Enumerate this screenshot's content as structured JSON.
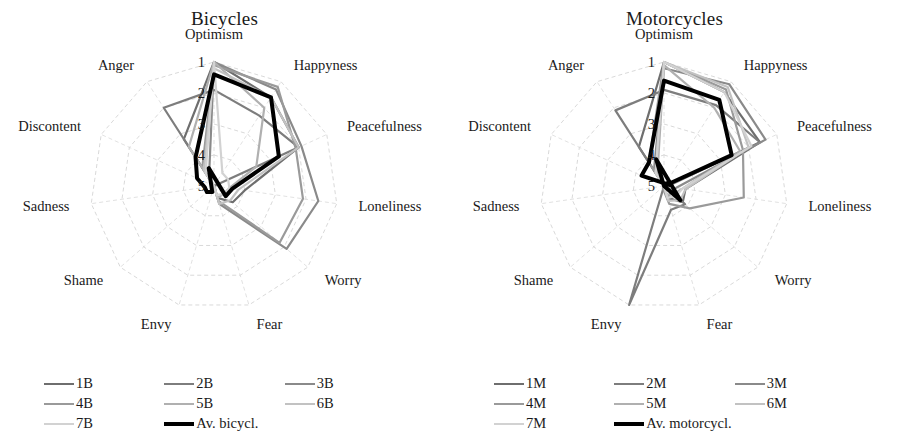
{
  "page": {
    "background": "#ffffff",
    "width": 899,
    "height": 440
  },
  "panels": [
    {
      "id": "bicycles",
      "title": "Bicycles",
      "legend": [
        {
          "label": "1B",
          "color": "#6e6e6e",
          "width": 2.4
        },
        {
          "label": "2B",
          "color": "#7d7d7d",
          "width": 2.4
        },
        {
          "label": "3B",
          "color": "#8a8a8a",
          "width": 2.4
        },
        {
          "label": "4B",
          "color": "#9a9a9a",
          "width": 2.4
        },
        {
          "label": "5B",
          "color": "#b0b0b0",
          "width": 2.4
        },
        {
          "label": "6B",
          "color": "#c2c2c2",
          "width": 2.4
        },
        {
          "label": "7B",
          "color": "#d2d2d2",
          "width": 2.4
        },
        {
          "label": "Av. bicycl.",
          "color": "#000000",
          "width": 4.0
        }
      ]
    },
    {
      "id": "motorcycles",
      "title": "Motorcycles",
      "legend": [
        {
          "label": "1M",
          "color": "#6e6e6e",
          "width": 2.4
        },
        {
          "label": "2M",
          "color": "#7d7d7d",
          "width": 2.4
        },
        {
          "label": "3M",
          "color": "#8a8a8a",
          "width": 2.4
        },
        {
          "label": "4M",
          "color": "#9a9a9a",
          "width": 2.4
        },
        {
          "label": "5M",
          "color": "#b0b0b0",
          "width": 2.4
        },
        {
          "label": "6M",
          "color": "#c2c2c2",
          "width": 2.4
        },
        {
          "label": "7M",
          "color": "#d2d2d2",
          "width": 2.4
        },
        {
          "label": "Av. motorcycl.",
          "color": "#000000",
          "width": 4.0
        }
      ]
    }
  ],
  "chart_data": [
    {
      "type": "radar",
      "title": "Bicycles",
      "xlabel": "",
      "ylabel": "",
      "grid": true,
      "legend_position": "bottom",
      "axis_direction": "inverted",
      "rlim": [
        1,
        5
      ],
      "rticks": [
        1,
        2,
        3,
        4,
        5
      ],
      "rtick_labels": [
        "1",
        "2",
        "3",
        "4",
        "5"
      ],
      "categories": [
        "Optimism",
        "Happyness",
        "Peacefulness",
        "Loneliness",
        "Worry",
        "Fear",
        "Envy",
        "Shame",
        "Sadness",
        "Discontent",
        "Anger"
      ],
      "series": [
        {
          "name": "1B",
          "color": "#6e6e6e",
          "values": [
            1.0,
            1.6,
            2.0,
            4.0,
            4.2,
            4.6,
            5.0,
            5.0,
            5.0,
            5.0,
            3.2
          ]
        },
        {
          "name": "2B",
          "color": "#7d7d7d",
          "values": [
            1.9,
            2.3,
            2.0,
            5.0,
            5.0,
            5.0,
            5.0,
            5.0,
            5.0,
            5.0,
            2.0
          ]
        },
        {
          "name": "3B",
          "color": "#8a8a8a",
          "values": [
            1.0,
            1.3,
            1.9,
            1.6,
            1.9,
            4.4,
            5.0,
            5.0,
            5.0,
            5.0,
            4.7
          ]
        },
        {
          "name": "4B",
          "color": "#9a9a9a",
          "values": [
            1.1,
            1.2,
            2.1,
            2.1,
            2.2,
            4.5,
            5.0,
            5.0,
            5.0,
            5.0,
            4.3
          ]
        },
        {
          "name": "5B",
          "color": "#b0b0b0",
          "values": [
            1.0,
            2.0,
            3.5,
            4.5,
            4.6,
            4.6,
            5.0,
            5.0,
            5.0,
            5.0,
            3.5
          ]
        },
        {
          "name": "6B",
          "color": "#c2c2c2",
          "values": [
            1.2,
            1.6,
            2.0,
            4.2,
            4.3,
            4.4,
            5.0,
            5.0,
            5.0,
            5.0,
            4.4
          ]
        },
        {
          "name": "7B",
          "color": "#d2d2d2",
          "values": [
            1.0,
            4.5,
            4.5,
            4.5,
            4.6,
            4.7,
            5.0,
            5.0,
            5.0,
            5.0,
            4.5
          ]
        },
        {
          "name": "Av. bicycl.",
          "color": "#000000",
          "values": [
            1.4,
            1.6,
            2.7,
            4.4,
            4.5,
            5.6,
            4.8,
            4.7,
            4.7,
            4.4,
            3.9
          ]
        }
      ]
    },
    {
      "type": "radar",
      "title": "Motorcycles",
      "xlabel": "",
      "ylabel": "",
      "grid": true,
      "legend_position": "bottom",
      "axis_direction": "inverted",
      "rlim": [
        1,
        5
      ],
      "rticks": [
        1,
        2,
        3,
        4,
        5
      ],
      "rtick_labels": [
        "1",
        "2",
        "3",
        "4",
        "5"
      ],
      "categories": [
        "Optimism",
        "Happyness",
        "Peacefulness",
        "Loneliness",
        "Worry",
        "Fear",
        "Envy",
        "Shame",
        "Sadness",
        "Discontent",
        "Anger"
      ],
      "series": [
        {
          "name": "1M",
          "color": "#6e6e6e",
          "values": [
            1.0,
            1.4,
            1.6,
            4.3,
            4.2,
            4.6,
            5.0,
            5.0,
            5.0,
            5.0,
            3.5
          ]
        },
        {
          "name": "2M",
          "color": "#7d7d7d",
          "values": [
            1.9,
            1.9,
            1.6,
            4.9,
            4.1,
            4.2,
            1.0,
            5.0,
            5.0,
            5.0,
            2.1
          ]
        },
        {
          "name": "3M",
          "color": "#8a8a8a",
          "values": [
            1.2,
            1.1,
            1.4,
            4.6,
            4.7,
            4.6,
            5.0,
            5.0,
            5.0,
            5.0,
            4.4
          ]
        },
        {
          "name": "4M",
          "color": "#9a9a9a",
          "values": [
            1.0,
            1.3,
            2.2,
            2.4,
            3.9,
            4.4,
            4.9,
            5.0,
            5.0,
            5.0,
            4.1
          ]
        },
        {
          "name": "5M",
          "color": "#b0b0b0",
          "values": [
            1.1,
            2.0,
            2.3,
            4.4,
            4.6,
            4.7,
            5.0,
            5.0,
            5.0,
            5.0,
            4.6
          ]
        },
        {
          "name": "6M",
          "color": "#c2c2c2",
          "values": [
            1.0,
            1.2,
            2.0,
            4.3,
            4.3,
            4.5,
            5.0,
            5.0,
            5.0,
            5.0,
            4.5
          ]
        },
        {
          "name": "7M",
          "color": "#d2d2d2",
          "values": [
            1.0,
            1.4,
            1.9,
            4.4,
            4.5,
            4.6,
            5.0,
            5.0,
            5.0,
            5.0,
            4.5
          ]
        },
        {
          "name": "Av. motorcycl.",
          "color": "#000000",
          "values": [
            1.6,
            1.7,
            2.6,
            5.0,
            4.3,
            5.9,
            5.0,
            5.2,
            5.2,
            4.2,
            4.1
          ]
        }
      ]
    }
  ]
}
